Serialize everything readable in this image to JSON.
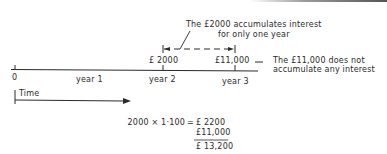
{
  "annotation_top": {
    "line1": "The £2000 accumulates interest",
    "line2": "for only one year"
  },
  "timeline": {
    "amount_year2": "£ 2000",
    "amount_year3": "£11,000",
    "dash": "—",
    "labels": {
      "zero": "0",
      "year1": "year 1",
      "year2": "year 2",
      "year3": "year 3"
    },
    "time_label": "Time"
  },
  "annotation_right": {
    "line1": "The £11,000 does not",
    "line2": "accumulate any interest"
  },
  "calculation": {
    "expression": "2000 × 1·100",
    "equals": "=",
    "result1": "£ 2200",
    "result2": "£11,000",
    "total": "£ 13,200"
  },
  "colors": {
    "ink": "#2a2a2a",
    "background": "#ffffff"
  }
}
